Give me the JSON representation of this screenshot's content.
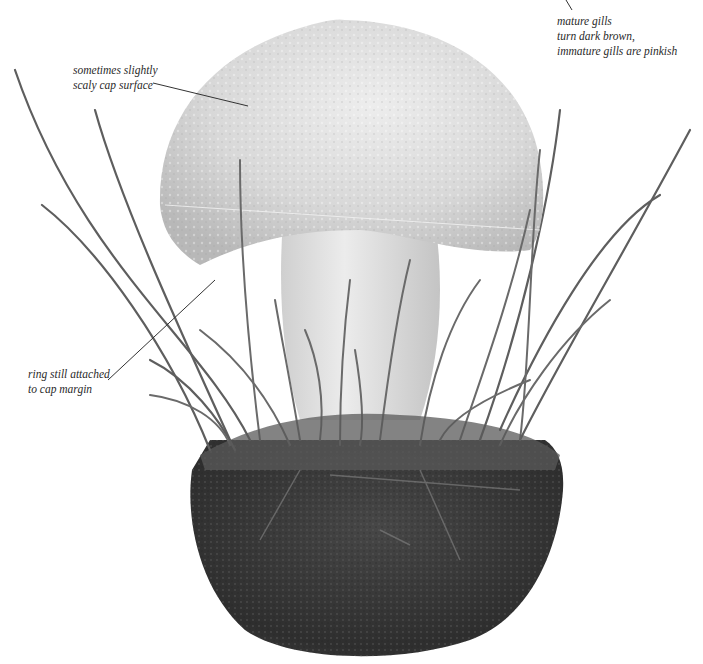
{
  "annotations": {
    "gills": {
      "lines": [
        "mature gills",
        "turn dark brown,",
        "immature gills are pinkish"
      ]
    },
    "cap": {
      "lines": [
        "sometimes slightly",
        "scaly cap surface"
      ]
    },
    "ring": {
      "lines": [
        "ring still attached",
        "to cap margin"
      ]
    }
  },
  "colors": {
    "background": "#ffffff",
    "cap": "#d9d9d9",
    "stem": "#e2e2e2",
    "grass": "#6e6e6e",
    "soil": "#3a3a3a",
    "label_text": "#2a2a2a",
    "leader_line": "#333333"
  }
}
